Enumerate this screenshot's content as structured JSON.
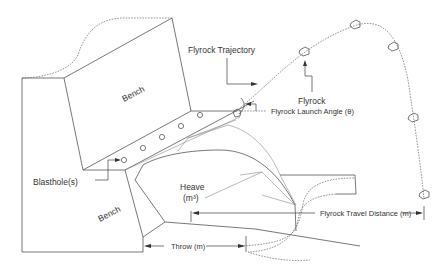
{
  "diagram": {
    "colors": {
      "line": "#555555",
      "text": "#333333",
      "background": "#ffffff"
    },
    "labels": {
      "bench_upper": "Bench",
      "bench_lower": "Bench",
      "blastholes": "Blasthole(s)",
      "heave": "Heave",
      "heave_unit": "(m³)",
      "throw": "Throw (m)",
      "flyrock_trajectory": "Flyrock Trajectory",
      "flyrock": "Flyrock",
      "launch_angle": "Flyrock Launch Angle (θ)",
      "travel_distance": "Flyrock Travel Distance (m)"
    },
    "blasthole_count": 5,
    "flyrock_fragments_count": 5
  }
}
